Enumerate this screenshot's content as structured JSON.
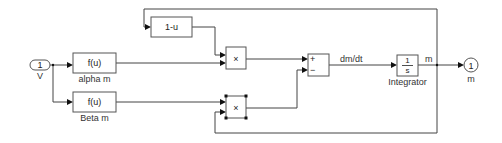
{
  "diagram": {
    "type": "simulink-block-diagram",
    "inport": {
      "number": "1",
      "label": "V"
    },
    "outport": {
      "number": "1",
      "label": "m"
    },
    "blocks": {
      "alpha_fcn": {
        "text": "f(u)",
        "label": "alpha m"
      },
      "beta_fcn": {
        "text": "f(u)",
        "label": "Beta m"
      },
      "one_minus_u": {
        "text": "1-u"
      },
      "product_top": {
        "text": "×"
      },
      "product_bottom": {
        "text": "×"
      },
      "sum": {
        "plus": "+",
        "minus": "−"
      },
      "integrator": {
        "num": "1",
        "den": "s",
        "label": "Integrator"
      }
    },
    "signals": {
      "derivative": "dm/dt",
      "output": "m"
    }
  }
}
